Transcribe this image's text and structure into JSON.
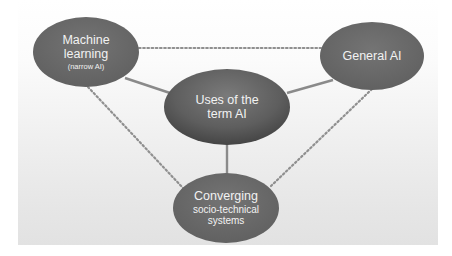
{
  "diagram": {
    "colors": {
      "node_fill": "#6b6b6b",
      "node_fill_dark": "#4a4a4a",
      "node_text": "#f2f2f2",
      "solid_connector": "#8a8a8a",
      "dotted_connector": "#8f8f8f",
      "background_top": "#ffffff",
      "background_bottom": "#e2e2e2"
    },
    "nodes": {
      "center": {
        "line1": "Uses of the",
        "line2": "term AI"
      },
      "machine_learning": {
        "line1": "Machine",
        "line2": "learning",
        "sub": "(narrow AI)"
      },
      "general_ai": {
        "line1": "General AI"
      },
      "converging": {
        "line1": "Converging",
        "line2": "socio-technical",
        "line3": "systems"
      }
    },
    "connections": {
      "solid": [
        [
          "Uses of the term AI",
          "Machine learning (narrow AI)"
        ],
        [
          "Uses of the term AI",
          "General AI"
        ],
        [
          "Uses of the term AI",
          "Converging socio-technical systems"
        ]
      ],
      "dotted": [
        [
          "Machine learning (narrow AI)",
          "General AI"
        ],
        [
          "Machine learning (narrow AI)",
          "Converging socio-technical systems"
        ],
        [
          "General AI",
          "Converging socio-technical systems"
        ]
      ]
    }
  }
}
